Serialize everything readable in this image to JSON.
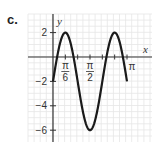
{
  "panel": {
    "label": "c."
  },
  "chart_data": {
    "type": "line",
    "title": "",
    "xlabel": "x",
    "ylabel": "y",
    "function": "y = 4 sin(3x) - 2",
    "x_ticks": [
      {
        "value": 0.5236,
        "label_num": "π",
        "label_den": "6"
      },
      {
        "value": 1.5708,
        "label_num": "π",
        "label_den": "2"
      },
      {
        "value": 3.1416,
        "label": "π"
      }
    ],
    "y_ticks": [
      {
        "value": 2,
        "label": "2"
      },
      {
        "value": -2,
        "label": "−2"
      },
      {
        "value": -4,
        "label": "−4"
      },
      {
        "value": -6,
        "label": "−6"
      }
    ],
    "xlim": [
      0,
      3.1416
    ],
    "ylim": [
      -6,
      2
    ],
    "grid": true,
    "series": [
      {
        "name": "curve",
        "x": [
          0,
          0.5236,
          1.0472,
          1.5708,
          2.0944,
          2.618,
          3.1416
        ],
        "y": [
          -2,
          2,
          -2,
          -6,
          -2,
          2,
          -2
        ]
      }
    ],
    "key_points": [
      {
        "x": 0,
        "y": -2
      },
      {
        "x": 0.5236,
        "y": 2,
        "note": "max"
      },
      {
        "x": 1.5708,
        "y": -6,
        "note": "min"
      },
      {
        "x": 2.618,
        "y": 2,
        "note": "max"
      },
      {
        "x": 3.1416,
        "y": -2
      }
    ]
  },
  "colors": {
    "curve": "#1a1a1a",
    "axis": "#333333",
    "grid": "#e6e6e6"
  }
}
